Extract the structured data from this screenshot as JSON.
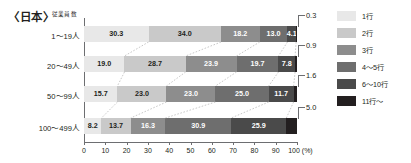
{
  "header": {
    "region_title": "〈日本〉",
    "axis_caption": "従業員数"
  },
  "legend": {
    "items": [
      {
        "label": "1行",
        "color": "#e8e8e8"
      },
      {
        "label": "2行",
        "color": "#c9c9c9"
      },
      {
        "label": "3行",
        "color": "#8d8d8d"
      },
      {
        "label": "4〜5行",
        "color": "#6e6e6e"
      },
      {
        "label": "6〜10行",
        "color": "#4a4a4a"
      },
      {
        "label": "11行〜",
        "color": "#231f20"
      }
    ]
  },
  "axis": {
    "ticks": [
      "0",
      "10",
      "20",
      "30",
      "40",
      "50",
      "60",
      "70",
      "80",
      "90",
      "100"
    ],
    "unit": "(%)",
    "min": 0,
    "max": 100
  },
  "chart_data": {
    "type": "bar",
    "title": "〈日本〉",
    "subtitle": "従業員数",
    "orientation": "horizontal",
    "stacked": true,
    "normalized_percent": true,
    "xlabel": "(%)",
    "ylabel": "従業員数",
    "xlim": [
      0,
      100
    ],
    "grid": false,
    "legend_position": "right",
    "categories": [
      "1〜19人",
      "20〜49人",
      "50〜99人",
      "100〜499人"
    ],
    "series": [
      {
        "name": "1行",
        "color": "#e8e8e8",
        "values": [
          30.3,
          19.0,
          15.7,
          8.2
        ]
      },
      {
        "name": "2行",
        "color": "#c9c9c9",
        "values": [
          34.0,
          28.7,
          23.0,
          13.7
        ]
      },
      {
        "name": "3行",
        "color": "#8d8d8d",
        "values": [
          18.2,
          23.9,
          23.0,
          16.3
        ]
      },
      {
        "name": "4〜5行",
        "color": "#6e6e6e",
        "values": [
          13.0,
          19.7,
          25.0,
          30.9
        ]
      },
      {
        "name": "6〜10行",
        "color": "#4a4a4a",
        "values": [
          4.1,
          7.8,
          11.7,
          25.9
        ]
      },
      {
        "name": "11行〜",
        "color": "#231f20",
        "values": [
          0.3,
          0.9,
          1.6,
          5.0
        ]
      }
    ],
    "callout_values": [
      "0.3",
      "0.9",
      "1.6",
      "5.0"
    ],
    "callout_series": "11行〜"
  }
}
